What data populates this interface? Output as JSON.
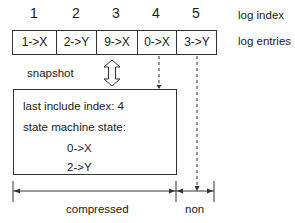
{
  "log": {
    "index_label": "log index",
    "entries_label": "log entries",
    "indices": [
      "1",
      "2",
      "3",
      "4",
      "5"
    ],
    "entries": [
      "1->X",
      "2->Y",
      "9->X",
      "0->X",
      "3->Y"
    ]
  },
  "snapshot": {
    "label": "snapshot",
    "last_include_index": "last include index: 4",
    "state_label": "state machine state:",
    "state_entries": [
      "0->X",
      "2->Y"
    ]
  },
  "ranges": {
    "compressed_label": "compressed",
    "non_label": "non"
  },
  "colors": {
    "line": "#333333",
    "background": "#ffffff"
  }
}
